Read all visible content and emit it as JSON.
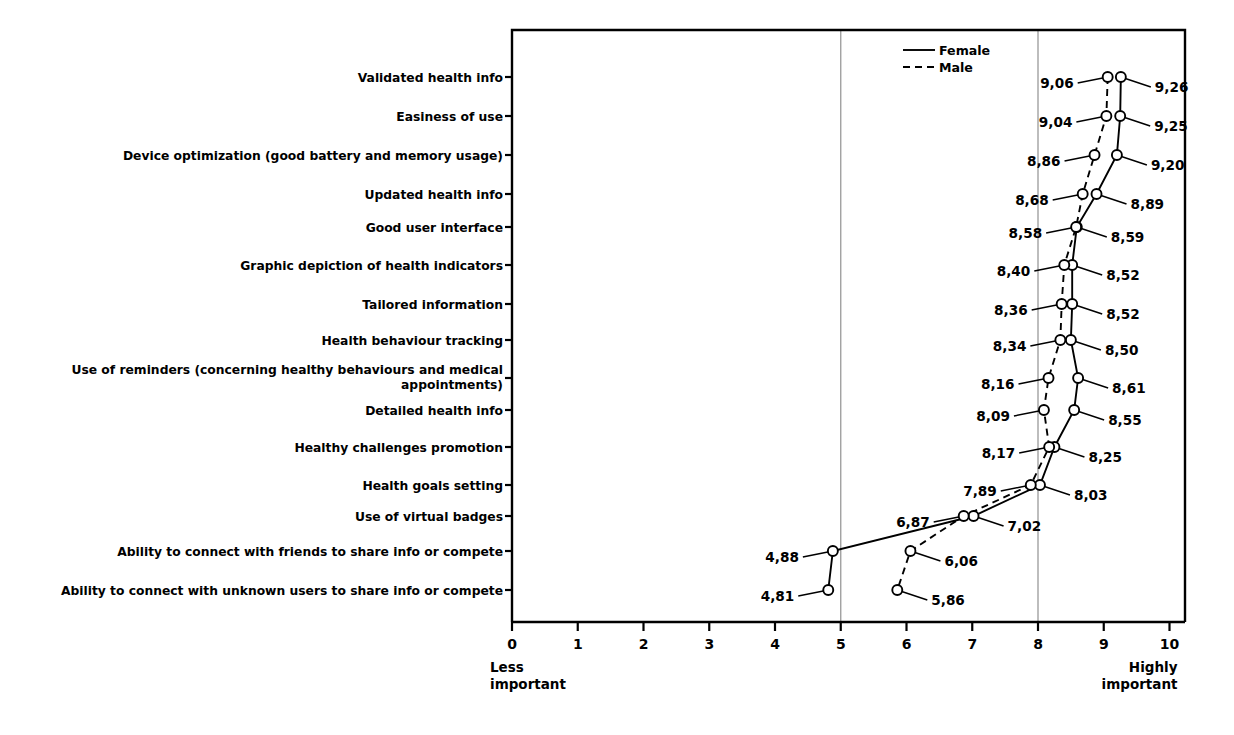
{
  "chart_data": {
    "type": "line",
    "title": "",
    "subtitle": "",
    "xlabel": "",
    "ylabel": "",
    "xlim": [
      0,
      10
    ],
    "xticks": [
      "0",
      "1",
      "2",
      "3",
      "4",
      "5",
      "6",
      "7",
      "8",
      "9",
      "10"
    ],
    "gridlines_x": [
      5,
      8
    ],
    "grid": true,
    "orientation": "horizontal",
    "axis_end_labels": {
      "low_line1": "Less",
      "low_line2": "important",
      "high_line1": "Highly",
      "high_line2": "important"
    },
    "legend": {
      "position": "top-right-inside",
      "entries": [
        {
          "name": "Female",
          "style": "solid"
        },
        {
          "name": "Male",
          "style": "dashed"
        }
      ]
    },
    "categories": [
      "Validated health info",
      "Easiness of use",
      "Device optimization (good battery and memory usage)",
      "Updated health info",
      "Good user interface",
      "Graphic depiction of health indicators",
      "Tailored information",
      "Health behaviour tracking",
      "Use of reminders (concerning healthy behaviours and medical appointments)",
      "Detailed health info",
      "Healthy challenges promotion",
      "Health goals setting",
      "Use of virtual badges",
      "Ability to connect with friends to share info or compete",
      "Ability to connect with unknown users to share info or compete"
    ],
    "categories_wrapped": [
      [
        "Validated health info"
      ],
      [
        "Easiness of use"
      ],
      [
        "Device optimization (good battery and memory usage)"
      ],
      [
        "Updated health info"
      ],
      [
        "Good user interface"
      ],
      [
        "Graphic depiction of health indicators"
      ],
      [
        "Tailored information"
      ],
      [
        "Health behaviour tracking"
      ],
      [
        "Use of reminders (concerning healthy behaviours and medical",
        "appointments)"
      ],
      [
        "Detailed health info"
      ],
      [
        "Healthy challenges promotion"
      ],
      [
        "Health goals setting"
      ],
      [
        "Use of virtual badges"
      ],
      [
        "Ability to connect with friends to share info or compete"
      ],
      [
        "Ability to connect with unknown users to share info or compete"
      ]
    ],
    "series": [
      {
        "name": "Female",
        "style": "solid",
        "values": [
          9.26,
          9.25,
          9.2,
          8.89,
          8.59,
          8.52,
          8.52,
          8.5,
          8.61,
          8.55,
          8.25,
          8.03,
          7.02,
          4.88,
          4.81
        ],
        "labels": [
          "9,26",
          "9,25",
          "9,20",
          "8,89",
          "8,59",
          "8,52",
          "8,52",
          "8,50",
          "8,61",
          "8,55",
          "8,25",
          "8,03",
          "7,02",
          "4,88",
          "4,81"
        ]
      },
      {
        "name": "Male",
        "style": "dashed",
        "values": [
          9.06,
          9.04,
          8.86,
          8.68,
          8.58,
          8.4,
          8.36,
          8.34,
          8.16,
          8.09,
          8.17,
          7.89,
          6.87,
          6.06,
          5.86
        ],
        "labels": [
          "9,06",
          "9,04",
          "8,86",
          "8,68",
          "8,58",
          "8,40",
          "8,36",
          "8,34",
          "8,16",
          "8,09",
          "8,17",
          "7,89",
          "6,87",
          "6,06",
          "5,86"
        ]
      }
    ],
    "label_sides": {
      "Female": [
        "right",
        "right",
        "right",
        "right",
        "right",
        "right",
        "right",
        "right",
        "right",
        "right",
        "right",
        "right",
        "right",
        "left",
        "left"
      ],
      "Male": [
        "left",
        "left",
        "left",
        "left",
        "left",
        "left",
        "left",
        "left",
        "left",
        "left",
        "left",
        "left",
        "left",
        "right",
        "right"
      ]
    }
  },
  "colors": {
    "line": "#000000",
    "grid": "#9a9a9a",
    "axis": "#000000",
    "background": "#ffffff",
    "marker_fill": "#ffffff"
  }
}
